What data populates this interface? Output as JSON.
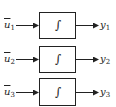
{
  "diagram": {
    "blocks": [
      {
        "input": {
          "symbol": "u",
          "sub": "1"
        },
        "operator": "∫",
        "output": {
          "symbol": "y",
          "sub": "1"
        }
      },
      {
        "input": {
          "symbol": "u",
          "sub": "2"
        },
        "operator": "∫",
        "output": {
          "symbol": "y",
          "sub": "2"
        }
      },
      {
        "input": {
          "symbol": "u",
          "sub": "3"
        },
        "operator": "∫",
        "output": {
          "symbol": "y",
          "sub": "3"
        }
      }
    ],
    "colors": {
      "stroke": "#222222",
      "background": "#ffffff"
    }
  }
}
